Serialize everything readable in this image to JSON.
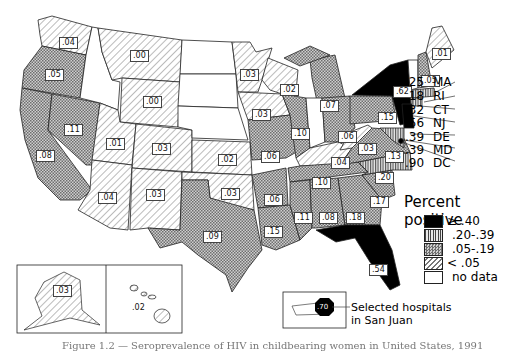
{
  "figure": {
    "caption_partial": "Figure 1.2 — Seroprevalence of HIV in childbearing women in United States, 1991"
  },
  "legend": {
    "title": "Percent positive",
    "items": [
      {
        "label": "≥ .40",
        "pattern": "solid-black"
      },
      {
        "label": ".20-.39",
        "pattern": "vertical-lines"
      },
      {
        "label": ".05-.19",
        "pattern": "crosshatch"
      },
      {
        "label": "< .05",
        "pattern": "diagonal-lines"
      },
      {
        "label": "no data",
        "pattern": "white"
      }
    ]
  },
  "states": {
    "WA": ".04",
    "OR": ".05",
    "CA": ".08",
    "NV": ".11",
    "ID": "",
    "MT": ".00",
    "WY": ".00",
    "UT": ".01",
    "CO": ".03",
    "AZ": ".04",
    "NM": ".03",
    "ND": "",
    "SD": "",
    "NE": "",
    "KS": ".02",
    "OK": ".03",
    "TX": ".09",
    "MN": ".03",
    "IA": ".03",
    "MO": ".06",
    "AR": ".06",
    "LA": ".15",
    "WI": ".02",
    "IL": ".10",
    "MI": ".07",
    "IN": "",
    "OH": ".06",
    "KY": ".04",
    "TN": ".10",
    "MS": ".11",
    "AL": ".08",
    "GA": ".18",
    "FL": ".54",
    "SC": ".17",
    "NC": ".20",
    "VA": ".13",
    "WV": ".03",
    "PA": ".15",
    "NY": ".62",
    "VT": "",
    "NH": ".05",
    "ME": ".01",
    "AK": ".03",
    "HI": ".02"
  },
  "northeast_callouts": [
    {
      "value": ".25",
      "state": "MA"
    },
    {
      "value": ".18",
      "state": "RI"
    },
    {
      "value": ".32",
      "state": "CT"
    },
    {
      "value": ".56",
      "state": "NJ"
    },
    {
      "value": ".39",
      "state": "DE"
    },
    {
      "value": ".39",
      "state": "MD"
    },
    {
      "value": ".90",
      "state": "DC"
    }
  ],
  "puerto_rico": {
    "value": ".70",
    "note_line1": "Selected hospitals",
    "note_line2": "in San Juan"
  }
}
